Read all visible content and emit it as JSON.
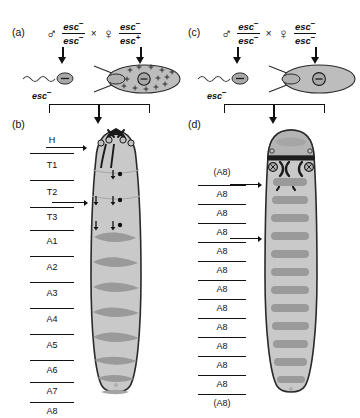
{
  "figure": {
    "gene": "esc",
    "allele_minus": "−",
    "allele_plus": "+",
    "cross_operator": "×",
    "male_symbol": "♂",
    "female_symbol": "♀"
  },
  "panels": {
    "a": {
      "letter": "(a)",
      "male": {
        "symbol": "♂",
        "numerator": "esc",
        "numerator_sup": "−",
        "denominator": "esc",
        "denominator_sup": "−"
      },
      "female": {
        "symbol": "♀",
        "numerator": "esc",
        "numerator_sup": "−",
        "denominator": "esc",
        "denominator_sup": "+"
      },
      "sperm_label": "esc",
      "sperm_label_sup": "−",
      "sperm_nucleus": "−",
      "egg_nucleus": "−",
      "egg_maternal_product": "+",
      "egg_has_maternal_product": true
    },
    "b": {
      "letter": "(b)",
      "segment_labels": [
        "H",
        "T1",
        "T2",
        "T3",
        "A1",
        "A2",
        "A3",
        "A4",
        "A5",
        "A6",
        "A7",
        "A8"
      ]
    },
    "c": {
      "letter": "(c)",
      "male": {
        "symbol": "♂",
        "numerator": "esc",
        "numerator_sup": "−",
        "denominator": "esc",
        "denominator_sup": "−"
      },
      "female": {
        "symbol": "♀",
        "numerator": "esc",
        "numerator_sup": "−",
        "denominator": "esc",
        "denominator_sup": "−"
      },
      "sperm_label": "esc",
      "sperm_label_sup": "−",
      "sperm_nucleus": "−",
      "egg_nucleus": "−",
      "egg_maternal_product": "+",
      "egg_has_maternal_product": false
    },
    "d": {
      "letter": "(d)",
      "segment_labels": [
        "(A8)",
        "A8",
        "A8",
        "A8",
        "A8",
        "A8",
        "A8",
        "A8",
        "A8",
        "A8",
        "A8",
        "A8",
        "(A8)"
      ]
    }
  },
  "colors": {
    "ink": "#111111",
    "body_fill": "#c9c9c9",
    "body_fill_dark": "#bdbdbd",
    "denticle": "#9a9a9a",
    "denticle_dark": "#8e8e8e",
    "gamete_fill": "#a8a8a8",
    "egg_fill": "#bdbdbd",
    "head_cap": "#b4b4b4",
    "outline": "#2a2a2a",
    "background": "#ffffff"
  }
}
